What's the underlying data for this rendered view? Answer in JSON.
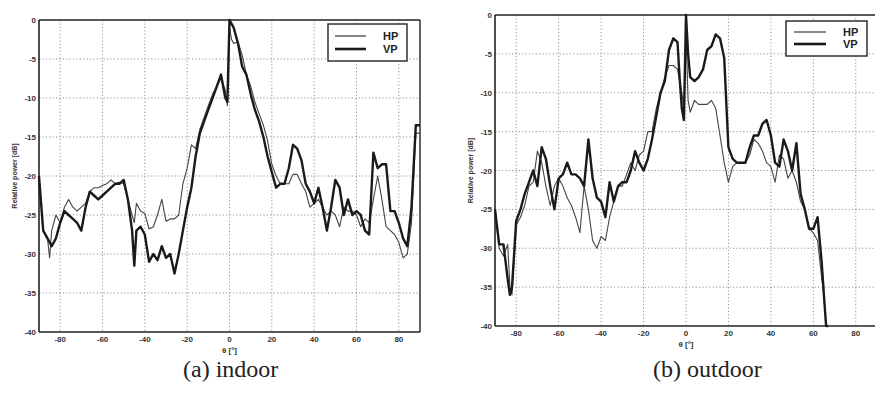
{
  "figure": {
    "captions": [
      "(a) indoor",
      "(b) outdoor"
    ]
  },
  "chart_data": [
    {
      "type": "line",
      "title": "(a) indoor",
      "xlabel": "θ [°]",
      "ylabel": "Relative power [dB]",
      "xlim": [
        -90,
        90
      ],
      "ylim": [
        -40,
        0
      ],
      "xticks": [
        -80,
        -60,
        -40,
        -20,
        0,
        20,
        40,
        60,
        80
      ],
      "yticks": [
        0,
        -5,
        -10,
        -15,
        -20,
        -25,
        -30,
        -35,
        -40
      ],
      "grid": true,
      "legend": {
        "position": "upper right",
        "entries": [
          "HP",
          "VP"
        ]
      },
      "series": [
        {
          "name": "HP",
          "style": "thin",
          "x": [
            -90,
            -88,
            -86,
            -85,
            -84,
            -82,
            -80,
            -78,
            -76,
            -74,
            -72,
            -70,
            -68,
            -66,
            -64,
            -62,
            -60,
            -58,
            -56,
            -54,
            -52,
            -50,
            -48,
            -46,
            -45,
            -44,
            -42,
            -40,
            -38,
            -36,
            -34,
            -32,
            -30,
            -28,
            -26,
            -24,
            -22,
            -20,
            -18,
            -16,
            -14,
            -12,
            -10,
            -8,
            -6,
            -4,
            -2,
            -1,
            0,
            1,
            2,
            4,
            6,
            8,
            10,
            12,
            14,
            16,
            18,
            20,
            22,
            24,
            26,
            28,
            30,
            32,
            34,
            36,
            38,
            40,
            42,
            44,
            46,
            48,
            50,
            52,
            54,
            56,
            58,
            60,
            62,
            64,
            66,
            68,
            70,
            72,
            74,
            76,
            78,
            80,
            82,
            84,
            86,
            88,
            90
          ],
          "y": [
            -20,
            -27,
            -28,
            -30.5,
            -27,
            -25,
            -26,
            -24,
            -23,
            -24,
            -24.5,
            -24,
            -23.5,
            -22,
            -21.5,
            -21.5,
            -21.2,
            -21,
            -20.5,
            -21,
            -20.8,
            -21,
            -23,
            -25,
            -26,
            -23.5,
            -24.5,
            -24.8,
            -26.8,
            -26.5,
            -25,
            -23,
            -25.8,
            -25.5,
            -25.5,
            -25,
            -21,
            -19,
            -16,
            -16.5,
            -14,
            -12.5,
            -11,
            -9.5,
            -8.5,
            -7.5,
            -9,
            -11,
            -1,
            -2.5,
            -3,
            -2.8,
            -4.5,
            -7,
            -8.5,
            -10.5,
            -12,
            -13.5,
            -15.5,
            -18.5,
            -20,
            -21,
            -21,
            -21,
            -19.8,
            -19.8,
            -21,
            -22,
            -24,
            -23.5,
            -23,
            -24,
            -25,
            -24.5,
            -25,
            -26.5,
            -24,
            -24.5,
            -24.5,
            -25,
            -26.5,
            -25.5,
            -26,
            -23,
            -20,
            -23,
            -26.5,
            -27,
            -27.5,
            -28.5,
            -30.5,
            -30,
            -26,
            -14.5,
            -14.5
          ]
        },
        {
          "name": "VP",
          "style": "thick",
          "x": [
            -90,
            -88,
            -86,
            -84,
            -82,
            -80,
            -78,
            -76,
            -74,
            -72,
            -70,
            -68,
            -66,
            -64,
            -62,
            -60,
            -58,
            -56,
            -54,
            -52,
            -50,
            -48,
            -46,
            -45,
            -44,
            -42,
            -40,
            -38,
            -36,
            -34,
            -32,
            -30,
            -28,
            -26,
            -24,
            -22,
            -20,
            -18,
            -16,
            -14,
            -12,
            -10,
            -8,
            -6,
            -4,
            -2,
            -1,
            0,
            1,
            2,
            4,
            6,
            8,
            10,
            12,
            14,
            16,
            18,
            20,
            22,
            24,
            26,
            28,
            30,
            32,
            34,
            36,
            38,
            40,
            42,
            44,
            46,
            48,
            50,
            52,
            54,
            56,
            58,
            60,
            62,
            64,
            66,
            68,
            70,
            72,
            74,
            76,
            78,
            80,
            82,
            84,
            86,
            88,
            90
          ],
          "y": [
            -20,
            -27,
            -28,
            -29,
            -28,
            -26,
            -24.5,
            -25,
            -25.5,
            -26,
            -27,
            -24,
            -22,
            -22.5,
            -23,
            -22.5,
            -22,
            -21.5,
            -21,
            -21,
            -20.5,
            -23,
            -27,
            -31.5,
            -27,
            -26.5,
            -27.5,
            -31,
            -30,
            -30.8,
            -29,
            -30.5,
            -30,
            -32.5,
            -30,
            -27,
            -24,
            -21.5,
            -17.5,
            -14.5,
            -13,
            -11.5,
            -10,
            -8.5,
            -7,
            -10,
            -10.5,
            0,
            -0.5,
            -1,
            -3,
            -6,
            -7,
            -9.5,
            -11.5,
            -13,
            -15,
            -17.5,
            -19.5,
            -21.5,
            -21,
            -21,
            -19,
            -16,
            -16.5,
            -18,
            -21,
            -22,
            -23.5,
            -21.5,
            -24,
            -27,
            -24,
            -20.5,
            -21.5,
            -25,
            -23,
            -25,
            -24.5,
            -25,
            -27,
            -27.5,
            -17,
            -19,
            -18.5,
            -18.5,
            -24.5,
            -24.5,
            -26,
            -28,
            -29,
            -24,
            -13.5,
            -13.5
          ]
        }
      ]
    },
    {
      "type": "line",
      "title": "(b) outdoor",
      "xlabel": "θ [°]",
      "ylabel": "Relative power [dB]",
      "xlim": [
        -90,
        90
      ],
      "ylim": [
        -40,
        0
      ],
      "xticks": [
        -80,
        -60,
        -40,
        -20,
        0,
        20,
        40,
        60,
        80
      ],
      "yticks": [
        0,
        -5,
        -10,
        -15,
        -20,
        -25,
        -30,
        -35,
        -40
      ],
      "grid": true,
      "legend": {
        "position": "upper right",
        "entries": [
          "HP",
          "VP"
        ]
      },
      "series": [
        {
          "name": "HP",
          "style": "thin",
          "x": [
            -90,
            -88,
            -86,
            -84,
            -83,
            -82,
            -80,
            -78,
            -76,
            -74,
            -72,
            -70,
            -68,
            -66,
            -64,
            -62,
            -60,
            -58,
            -56,
            -54,
            -52,
            -50,
            -48,
            -46,
            -44,
            -42,
            -40,
            -38,
            -36,
            -34,
            -32,
            -30,
            -28,
            -26,
            -24,
            -22,
            -20,
            -18,
            -16,
            -14,
            -12,
            -10,
            -8,
            -6,
            -4,
            -2,
            -1,
            0,
            1,
            2,
            4,
            6,
            8,
            10,
            12,
            14,
            16,
            18,
            20,
            22,
            24,
            26,
            28,
            30,
            32,
            34,
            36,
            38,
            40,
            42,
            44,
            46,
            48,
            50,
            52,
            54,
            56,
            58,
            60,
            62,
            64,
            65,
            66,
            67
          ],
          "y": [
            -25,
            -30,
            -31,
            -29.5,
            -35,
            -36,
            -27,
            -26,
            -24.5,
            -22,
            -21.5,
            -17.5,
            -19,
            -22,
            -24.5,
            -22,
            -21,
            -22,
            -23.5,
            -24.5,
            -26,
            -28,
            -22,
            -25,
            -29,
            -30,
            -28.5,
            -29,
            -26,
            -24,
            -22,
            -22,
            -20.5,
            -19,
            -20,
            -18,
            -17.5,
            -15,
            -15,
            -12,
            -10,
            -8,
            -6.5,
            -6.5,
            -7,
            -10,
            -12,
            -2,
            -11,
            -12.5,
            -11,
            -11.5,
            -11.5,
            -11.5,
            -11,
            -12,
            -15.5,
            -19,
            -21.5,
            -19.5,
            -19,
            -19,
            -19,
            -18,
            -16,
            -16.5,
            -17.5,
            -19,
            -19.5,
            -21.5,
            -18,
            -18.5,
            -21,
            -20,
            -21.5,
            -24,
            -25,
            -27.5,
            -28,
            -29,
            -34,
            -36,
            -40,
            -40
          ]
        },
        {
          "name": "VP",
          "style": "thick",
          "x": [
            -90,
            -88,
            -86,
            -84,
            -83,
            -82,
            -80,
            -78,
            -76,
            -74,
            -72,
            -70,
            -68,
            -66,
            -64,
            -62,
            -60,
            -58,
            -56,
            -54,
            -52,
            -50,
            -48,
            -46,
            -44,
            -42,
            -40,
            -38,
            -36,
            -34,
            -32,
            -30,
            -28,
            -26,
            -24,
            -22,
            -20,
            -18,
            -16,
            -14,
            -12,
            -10,
            -8,
            -6,
            -4,
            -3,
            -2,
            -1,
            0,
            1,
            2,
            4,
            6,
            8,
            10,
            12,
            14,
            16,
            18,
            20,
            22,
            24,
            26,
            28,
            30,
            32,
            34,
            36,
            38,
            40,
            42,
            44,
            46,
            48,
            50,
            52,
            54,
            56,
            58,
            60,
            62,
            64,
            65,
            66,
            67
          ],
          "y": [
            -25,
            -29.5,
            -29.5,
            -34,
            -36,
            -35,
            -26.5,
            -25,
            -23,
            -21.5,
            -20,
            -22,
            -17,
            -18.5,
            -22,
            -25,
            -21,
            -20.5,
            -19,
            -20.5,
            -20.5,
            -21,
            -22,
            -16,
            -21,
            -23.5,
            -24,
            -26,
            -21.5,
            -24,
            -22,
            -21.5,
            -21.5,
            -20,
            -17.5,
            -19,
            -20,
            -18.5,
            -16,
            -13,
            -10,
            -8.5,
            -4.5,
            -3,
            -3.5,
            -8,
            -12,
            -13.5,
            0,
            -5,
            -8,
            -8.5,
            -8,
            -7,
            -4.5,
            -4,
            -2.5,
            -3,
            -5.5,
            -17,
            -18.5,
            -19,
            -19,
            -19,
            -17,
            -15.5,
            -15.5,
            -14,
            -13.5,
            -15.5,
            -19,
            -19.5,
            -16,
            -17.5,
            -20,
            -16.5,
            -23,
            -25,
            -27.5,
            -27.5,
            -26,
            -32,
            -36,
            -40,
            -40
          ]
        }
      ]
    }
  ],
  "legend_labels": {
    "hp": "HP",
    "vp": "VP"
  },
  "axis_labels": {
    "x": "θ [°]",
    "y": "Relative power [dB]"
  }
}
